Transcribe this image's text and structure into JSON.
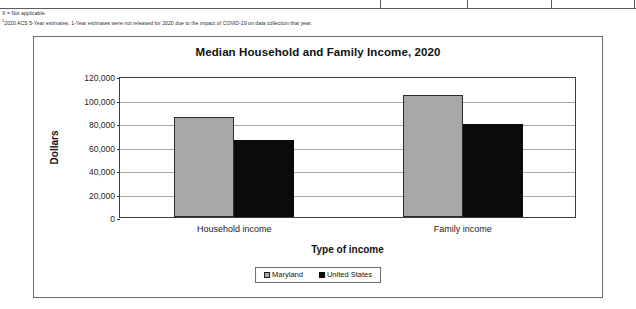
{
  "footnotes": [
    "X = Not applicable.",
    "2020 ACS 5-Year estimates. 1-Year estimates were not released for 2020 due to the impact of COVID-19 on data collection that year."
  ],
  "footnote_marker": "1",
  "chart_data": {
    "type": "bar",
    "title": "Median Household and Family Income, 2020",
    "xlabel": "Type of income",
    "ylabel": "Dollars",
    "categories": [
      "Household income",
      "Family income"
    ],
    "series": [
      {
        "name": "Maryland",
        "color": "#a8a8a8",
        "values": [
          85500,
          103500
        ]
      },
      {
        "name": "United States",
        "color": "#0b0b0b",
        "values": [
          65500,
          79000
        ]
      }
    ],
    "ylim": [
      0,
      120000
    ],
    "ytick_step": 20000,
    "ytick_labels": [
      "120,000",
      "100,000",
      "80,000",
      "60,000",
      "40,000",
      "20,000",
      "0"
    ],
    "ytick_values": [
      120000,
      100000,
      80000,
      60000,
      40000,
      20000,
      0
    ],
    "grid": true,
    "legend_position": "bottom"
  }
}
